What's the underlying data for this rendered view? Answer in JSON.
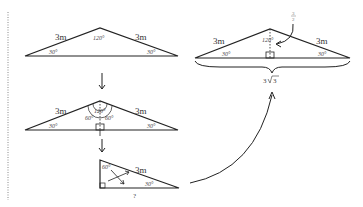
{
  "diagram": {
    "colors": {
      "stroke": "#222222",
      "text": "#333333",
      "divider": "#888888"
    },
    "step1": {
      "side_left": "3m",
      "side_right": "3m",
      "apex_angle": "120°",
      "base_left_angle": "30°",
      "base_right_angle": "30°"
    },
    "step2": {
      "side_left": "3m",
      "side_right": "3m",
      "apex_angle": "120°",
      "split_left_angle": "60°",
      "split_right_angle": "60°",
      "base_left_angle": "30°",
      "base_right_angle": "30°"
    },
    "step3": {
      "hypotenuse": "3m",
      "top_angle": "60°",
      "base_angle": "30°",
      "unknown_side": "?"
    },
    "result": {
      "side_left": "3m",
      "side_right": "3m",
      "apex_angle": "120°",
      "base_left_angle": "30°",
      "base_right_angle": "30°",
      "half_label_num": "3",
      "half_label_den": "2",
      "base_coefficient": "3",
      "base_radicand": "3"
    }
  }
}
